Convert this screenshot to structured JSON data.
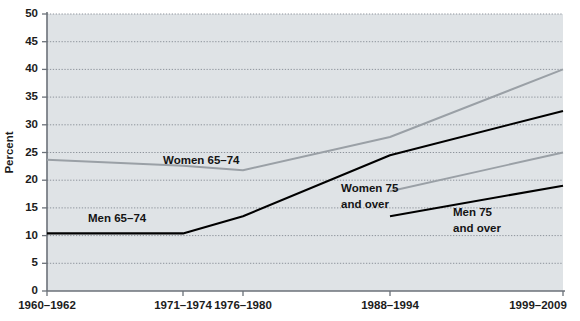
{
  "chart_data": {
    "type": "line",
    "title": "",
    "xlabel": "",
    "ylabel": "Percent",
    "ylim": [
      0,
      50
    ],
    "ytick_step": 5,
    "grid": true,
    "legend": "inline-labels",
    "categories": [
      "1960–1962",
      "1971–1974",
      "1976–1980",
      "1988–1994",
      "1999–2009"
    ],
    "yticks": [
      "0",
      "5",
      "10",
      "15",
      "20",
      "25",
      "30",
      "35",
      "40",
      "45",
      "50"
    ],
    "series": [
      {
        "name": "Women 65–74",
        "color": "#9aa0a6",
        "x": [
          "1960–1962",
          "1971–1974",
          "1976–1980",
          "1988–1994",
          "1999–2009"
        ],
        "values": [
          23.7,
          22.6,
          21.8,
          27.8,
          40.0
        ]
      },
      {
        "name": "Men 65–74",
        "color": "#000000",
        "x": [
          "1960–1962",
          "1971–1974",
          "1976–1980",
          "1988–1994",
          "1999–2009"
        ],
        "values": [
          10.4,
          10.4,
          13.5,
          24.5,
          32.5
        ]
      },
      {
        "name": "Women 75 and over",
        "color": "#9aa0a6",
        "x": [
          "1988–1994",
          "1999–2009"
        ],
        "values": [
          18.0,
          25.0
        ]
      },
      {
        "name": "Men 75 and over",
        "color": "#000000",
        "x": [
          "1988–1994",
          "1999–2009"
        ],
        "values": [
          13.5,
          19.0
        ]
      }
    ],
    "annotations": [
      {
        "text": "Women 65–74",
        "series": "Women 65–74"
      },
      {
        "text": "Men 65–74",
        "series": "Men 65–74"
      },
      {
        "text": "Women 75",
        "series": "Women 75 and over"
      },
      {
        "text": "and over",
        "series": "Women 75 and over"
      },
      {
        "text": "Men 75",
        "series": "Men 75 and over"
      },
      {
        "text": "and over",
        "series": "Men 75 and over"
      }
    ]
  },
  "colors": {
    "plot_background": "#dfe3e6",
    "page_background": "#ffffff",
    "axis": "#6b7179",
    "gridline": "#8d939b",
    "series_dark": "#000000",
    "series_light": "#9aa0a6",
    "text": "#1c1c1c"
  }
}
